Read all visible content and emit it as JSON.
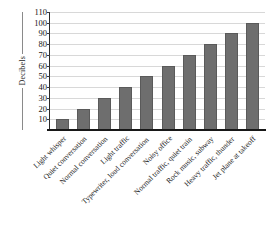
{
  "chart_data": {
    "type": "bar",
    "title": "",
    "xlabel": "",
    "ylabel": "Decibels",
    "ylim": [
      0,
      110
    ],
    "ytick_step": 10,
    "grid": true,
    "legend": false,
    "orientation": "vertical",
    "bar_color": "#6e6e6e",
    "categories": [
      "Light whisper",
      "Quiet conversation",
      "Normal conversation",
      "Light traffic",
      "Typewriter, loud conversation",
      "Noisy office",
      "Normal traffic, quiet train",
      "Rock music, subway",
      "Heavy traffic, thunder",
      "Jet plane at takeoff"
    ],
    "values": [
      10,
      20,
      30,
      40,
      50,
      60,
      70,
      80,
      90,
      100
    ],
    "yticks": [
      10,
      20,
      30,
      40,
      50,
      60,
      70,
      80,
      90,
      100,
      110
    ]
  }
}
